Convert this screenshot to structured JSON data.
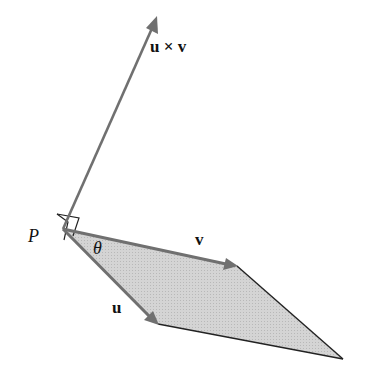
{
  "diagram": {
    "labels": {
      "cross": "u × v",
      "v": "v",
      "u": "u",
      "point": "P",
      "angle": "θ"
    },
    "colors": {
      "arrow": "#707070",
      "edge": "#222222",
      "fill": "#cfcfcf"
    },
    "points": {
      "P": [
        63,
        229
      ],
      "v_tip": [
        237,
        266
      ],
      "u_tip": [
        158,
        324
      ],
      "corner": [
        343,
        359
      ],
      "cross_tip": [
        157,
        18
      ]
    }
  }
}
